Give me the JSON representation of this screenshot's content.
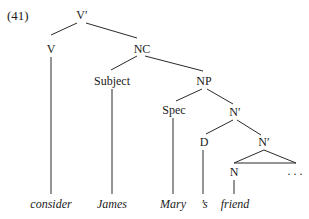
{
  "example_number": "(41)",
  "nodes": {
    "vbar": "V′",
    "v": "V",
    "nc": "NC",
    "subject": "Subject",
    "np": "NP",
    "spec": "Spec",
    "nbar1": "N′",
    "d": "D",
    "nbar2": "N′",
    "n": "N",
    "ellipsis": ". . ."
  },
  "leaves": {
    "consider": "consider",
    "james": "James",
    "mary": "Mary",
    "s": "’s",
    "friend": "friend"
  },
  "colors": {
    "line": "#2a2a2a",
    "text": "#1a1a1a",
    "background": "#ffffff"
  }
}
